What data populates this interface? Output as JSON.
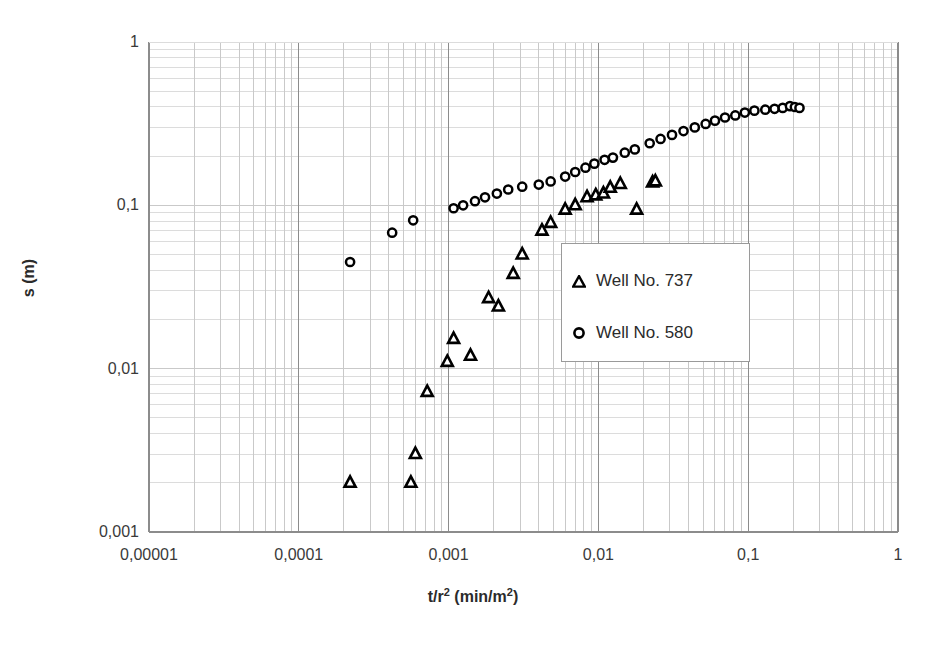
{
  "chart_data": {
    "type": "scatter",
    "title": "",
    "xlabel": "t/r2 (min/m2)",
    "ylabel": "s (m)",
    "xscale": "log",
    "yscale": "log",
    "xlim": [
      1e-05,
      1
    ],
    "ylim": [
      0.001,
      1
    ],
    "grid": true,
    "grid_minor": true,
    "legend_position": "center",
    "x_tick_labels": [
      "0,00001",
      "0,0001",
      "0,001",
      "0,01",
      "0,1",
      "1"
    ],
    "x_tick_values": [
      1e-05,
      0.0001,
      0.001,
      0.01,
      0.1,
      1
    ],
    "y_tick_labels": [
      "0,001",
      "0,01",
      "0,1",
      "1"
    ],
    "y_tick_values": [
      0.001,
      0.01,
      0.1,
      1
    ],
    "series": [
      {
        "name": "Well No. 737",
        "marker": "triangle",
        "marker_fill": "none",
        "marker_edge_color": "#000000",
        "points": [
          [
            0.00022,
            0.002
          ],
          [
            0.00056,
            0.002
          ],
          [
            0.0006,
            0.003
          ],
          [
            0.00072,
            0.0072
          ],
          [
            0.00098,
            0.011
          ],
          [
            0.00108,
            0.0152
          ],
          [
            0.0014,
            0.012
          ],
          [
            0.00185,
            0.027
          ],
          [
            0.00215,
            0.024
          ],
          [
            0.0027,
            0.038
          ],
          [
            0.0031,
            0.05
          ],
          [
            0.0042,
            0.07
          ],
          [
            0.0048,
            0.078
          ],
          [
            0.006,
            0.094
          ],
          [
            0.007,
            0.1
          ],
          [
            0.0084,
            0.112
          ],
          [
            0.0096,
            0.115
          ],
          [
            0.0108,
            0.118
          ],
          [
            0.012,
            0.128
          ],
          [
            0.014,
            0.135
          ],
          [
            0.018,
            0.094
          ],
          [
            0.023,
            0.138
          ],
          [
            0.024,
            0.14
          ]
        ]
      },
      {
        "name": "Well No. 580",
        "marker": "circle",
        "marker_fill": "none",
        "marker_edge_color": "#000000",
        "points": [
          [
            0.00022,
            0.045
          ],
          [
            0.00042,
            0.068
          ],
          [
            0.00058,
            0.081
          ],
          [
            0.00108,
            0.096
          ],
          [
            0.00125,
            0.1
          ],
          [
            0.0015,
            0.106
          ],
          [
            0.00175,
            0.112
          ],
          [
            0.0021,
            0.118
          ],
          [
            0.0025,
            0.125
          ],
          [
            0.0031,
            0.13
          ],
          [
            0.004,
            0.134
          ],
          [
            0.0048,
            0.14
          ],
          [
            0.006,
            0.15
          ],
          [
            0.007,
            0.16
          ],
          [
            0.0082,
            0.17
          ],
          [
            0.0094,
            0.18
          ],
          [
            0.011,
            0.19
          ],
          [
            0.0125,
            0.196
          ],
          [
            0.015,
            0.21
          ],
          [
            0.0175,
            0.22
          ],
          [
            0.022,
            0.24
          ],
          [
            0.026,
            0.255
          ],
          [
            0.031,
            0.27
          ],
          [
            0.037,
            0.285
          ],
          [
            0.044,
            0.3
          ],
          [
            0.052,
            0.315
          ],
          [
            0.06,
            0.33
          ],
          [
            0.07,
            0.345
          ],
          [
            0.082,
            0.355
          ],
          [
            0.095,
            0.37
          ],
          [
            0.11,
            0.38
          ],
          [
            0.13,
            0.385
          ],
          [
            0.15,
            0.39
          ],
          [
            0.17,
            0.395
          ],
          [
            0.19,
            0.405
          ],
          [
            0.205,
            0.4
          ],
          [
            0.22,
            0.395
          ]
        ]
      }
    ]
  },
  "plot_area": {
    "left": 149,
    "top": 42,
    "right": 898,
    "bottom": 532
  },
  "colors": {
    "major_grid": "#8c8c8c",
    "minor_grid": "#c9c9c9",
    "minor_grid_h": "#dcdcdc",
    "axis": "#8c8c8c",
    "marker": "#000000",
    "legend_border": "#9a9a9a",
    "text": "#2b2b2b"
  },
  "legend": {
    "entries": [
      {
        "label": "Well No. 737",
        "marker": "triangle"
      },
      {
        "label": "Well No. 580",
        "marker": "circle"
      }
    ]
  },
  "axis_titles": {
    "x_main": "t/r",
    "x_sup1": "2",
    "x_mid": " (min/m",
    "x_sup2": "2",
    "x_end": ")",
    "y": "s (m)"
  }
}
